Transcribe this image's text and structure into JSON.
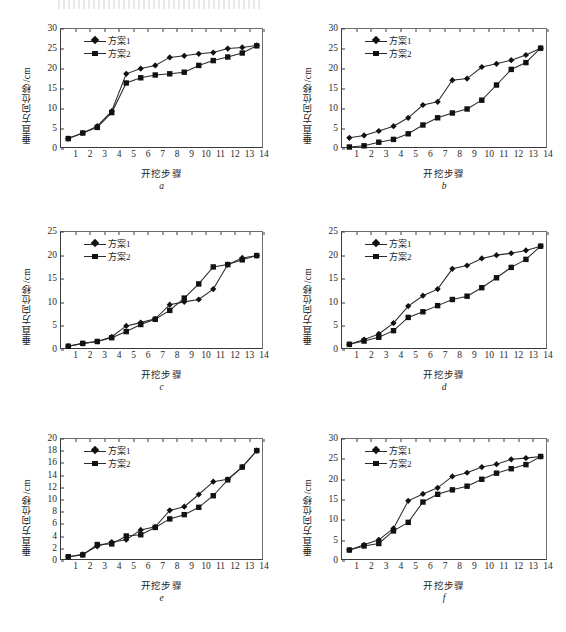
{
  "figure": {
    "axis_label_y": "垂直方向位移/cm",
    "axis_label_x": "开挖步骤",
    "legend": {
      "series1": "方案1",
      "series2": "方案2"
    },
    "marker_series1": "diamond",
    "marker_series2": "square",
    "line_color": "#2a2a2a"
  },
  "captions": {
    "a": "a",
    "b": "b",
    "c": "c",
    "d": "d",
    "e": "e",
    "f": "f"
  },
  "chart_data": [
    {
      "id": "a",
      "type": "line",
      "title": "",
      "xlabel": "开挖步骤",
      "ylabel": "垂直方向位移/cm",
      "xlim": [
        0,
        14
      ],
      "ylim": [
        0,
        30
      ],
      "yticks": [
        0,
        5,
        10,
        15,
        20,
        25,
        30
      ],
      "xticks": [
        1,
        2,
        3,
        4,
        5,
        6,
        7,
        8,
        9,
        10,
        11,
        12,
        13,
        14
      ],
      "grid": false,
      "legend_position": "top-left",
      "x": [
        0.5,
        1.5,
        2.5,
        3.5,
        4.5,
        5.5,
        6.5,
        7.5,
        8.5,
        9.5,
        10.5,
        11.5,
        12.5,
        13.5
      ],
      "series": [
        {
          "name": "方案1",
          "marker": "diamond",
          "values": [
            2.6,
            4.0,
            5.7,
            9.5,
            18.8,
            20.1,
            20.9,
            22.9,
            23.3,
            23.8,
            24.1,
            25.1,
            25.4,
            25.9
          ]
        },
        {
          "name": "方案2",
          "marker": "square",
          "values": [
            2.6,
            4.0,
            5.4,
            9.1,
            16.5,
            17.8,
            18.5,
            18.8,
            19.2,
            20.9,
            22.1,
            23.0,
            24.0,
            25.8
          ]
        }
      ]
    },
    {
      "id": "b",
      "type": "line",
      "title": "",
      "xlabel": "开挖步骤",
      "ylabel": "垂直方向位移/cm",
      "xlim": [
        0,
        14
      ],
      "ylim": [
        0,
        30
      ],
      "yticks": [
        0,
        5,
        10,
        15,
        20,
        25,
        30
      ],
      "xticks": [
        1,
        2,
        3,
        4,
        5,
        6,
        7,
        8,
        9,
        10,
        11,
        12,
        13,
        14
      ],
      "grid": false,
      "legend_position": "top-left",
      "x": [
        0.5,
        1.5,
        2.5,
        3.5,
        4.5,
        5.5,
        6.5,
        7.5,
        8.5,
        9.5,
        10.5,
        11.5,
        12.5,
        13.5
      ],
      "series": [
        {
          "name": "方案1",
          "marker": "diamond",
          "values": [
            2.8,
            3.4,
            4.5,
            5.7,
            7.8,
            11.0,
            11.8,
            17.2,
            17.6,
            20.5,
            21.3,
            22.2,
            23.5,
            25.2
          ]
        },
        {
          "name": "方案2",
          "marker": "square",
          "values": [
            0.5,
            0.8,
            1.7,
            2.4,
            3.8,
            6.0,
            7.8,
            9.0,
            10.0,
            12.2,
            16.0,
            19.9,
            21.6,
            25.2
          ]
        }
      ]
    },
    {
      "id": "c",
      "type": "line",
      "title": "",
      "xlabel": "开挖步骤",
      "ylabel": "垂直方向位移/cm",
      "xlim": [
        0,
        14
      ],
      "ylim": [
        0,
        25
      ],
      "yticks": [
        0,
        5,
        10,
        15,
        20,
        25
      ],
      "xticks": [
        1,
        2,
        3,
        4,
        5,
        6,
        7,
        8,
        9,
        10,
        11,
        12,
        13,
        14
      ],
      "grid": false,
      "legend_position": "top-left",
      "x": [
        0.5,
        1.5,
        2.5,
        3.5,
        4.5,
        5.5,
        6.5,
        7.5,
        8.5,
        9.5,
        10.5,
        11.5,
        12.5,
        13.5
      ],
      "series": [
        {
          "name": "方案1",
          "marker": "diamond",
          "values": [
            0.8,
            1.4,
            1.8,
            2.8,
            5.1,
            5.8,
            6.6,
            9.6,
            10.2,
            10.7,
            12.9,
            18.1,
            19.5,
            20.0
          ]
        },
        {
          "name": "方案2",
          "marker": "square",
          "values": [
            0.8,
            1.4,
            1.8,
            2.6,
            3.9,
            5.4,
            6.5,
            8.4,
            11.0,
            14.0,
            17.6,
            18.1,
            19.1,
            20.0
          ]
        }
      ]
    },
    {
      "id": "d",
      "type": "line",
      "title": "",
      "xlabel": "开挖步骤",
      "ylabel": "垂直方向位移/cm",
      "xlim": [
        0,
        14
      ],
      "ylim": [
        0,
        25
      ],
      "yticks": [
        0,
        5,
        10,
        15,
        20,
        25
      ],
      "xticks": [
        1,
        2,
        3,
        4,
        5,
        6,
        7,
        8,
        9,
        10,
        11,
        12,
        13,
        14
      ],
      "grid": false,
      "legend_position": "top-left",
      "x": [
        0.5,
        1.5,
        2.5,
        3.5,
        4.5,
        5.5,
        6.5,
        7.5,
        8.5,
        9.5,
        10.5,
        11.5,
        12.5,
        13.5
      ],
      "series": [
        {
          "name": "方案1",
          "marker": "diamond",
          "values": [
            1.2,
            2.2,
            3.4,
            5.7,
            9.3,
            11.5,
            12.9,
            17.2,
            17.9,
            19.4,
            20.1,
            20.5,
            21.1,
            22.0
          ]
        },
        {
          "name": "方案2",
          "marker": "square",
          "values": [
            1.2,
            1.9,
            2.7,
            4.1,
            6.9,
            8.1,
            9.4,
            10.7,
            11.4,
            13.2,
            15.3,
            17.5,
            19.2,
            22.0
          ]
        }
      ]
    },
    {
      "id": "e",
      "type": "line",
      "title": "",
      "xlabel": "开挖步骤",
      "ylabel": "垂直方向位移/cm",
      "xlim": [
        0,
        14
      ],
      "ylim": [
        0,
        20
      ],
      "yticks": [
        0,
        2,
        4,
        6,
        8,
        10,
        12,
        14,
        16,
        18,
        20
      ],
      "xticks": [
        1,
        2,
        3,
        4,
        5,
        6,
        7,
        8,
        9,
        10,
        11,
        12,
        13,
        14
      ],
      "grid": false,
      "legend_position": "top-left",
      "x": [
        0.5,
        1.5,
        2.5,
        3.5,
        4.5,
        5.5,
        6.5,
        7.5,
        8.5,
        9.5,
        10.5,
        11.5,
        12.5,
        13.5
      ],
      "series": [
        {
          "name": "方案1",
          "marker": "diamond",
          "values": [
            0.7,
            1.1,
            2.4,
            3.1,
            3.5,
            5.1,
            5.6,
            8.3,
            8.9,
            10.9,
            13.0,
            13.4,
            15.4,
            18.1
          ]
        },
        {
          "name": "方案2",
          "marker": "square",
          "values": [
            0.7,
            1.0,
            2.7,
            2.8,
            4.1,
            4.3,
            5.5,
            6.9,
            7.6,
            8.8,
            10.7,
            13.3,
            15.4,
            18.1
          ]
        }
      ]
    },
    {
      "id": "f",
      "type": "line",
      "title": "",
      "xlabel": "开挖步骤",
      "ylabel": "垂直方向位移/cm",
      "xlim": [
        0,
        14
      ],
      "ylim": [
        0,
        30
      ],
      "yticks": [
        0,
        5,
        10,
        15,
        20,
        25,
        30
      ],
      "xticks": [
        1,
        2,
        3,
        4,
        5,
        6,
        7,
        8,
        9,
        10,
        11,
        12,
        13,
        14
      ],
      "grid": false,
      "legend_position": "top-left",
      "x": [
        0.5,
        1.5,
        2.5,
        3.5,
        4.5,
        5.5,
        6.5,
        7.5,
        8.5,
        9.5,
        10.5,
        11.5,
        12.5,
        13.5
      ],
      "series": [
        {
          "name": "方案1",
          "marker": "diamond",
          "values": [
            2.7,
            4.0,
            5.2,
            8.0,
            14.8,
            16.5,
            18.0,
            20.8,
            21.7,
            23.1,
            23.8,
            25.0,
            25.3,
            25.7
          ]
        },
        {
          "name": "方案2",
          "marker": "square",
          "values": [
            2.7,
            3.7,
            4.3,
            7.4,
            9.5,
            14.5,
            16.4,
            17.5,
            18.4,
            20.1,
            21.6,
            22.7,
            23.7,
            25.7
          ]
        }
      ]
    }
  ]
}
